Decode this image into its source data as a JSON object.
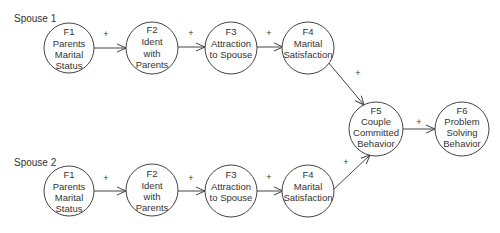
{
  "groups": [
    {
      "label": "Spouse 1"
    },
    {
      "label": "Spouse 2"
    }
  ],
  "nodes": [
    {
      "id": "s1f1",
      "lines": [
        "F1",
        "Parents",
        "Marital",
        "Status"
      ]
    },
    {
      "id": "s1f2",
      "lines": [
        "F2",
        "Ident",
        "with",
        "Parents"
      ]
    },
    {
      "id": "s1f3",
      "lines": [
        "F3",
        "Attraction",
        "to Spouse"
      ]
    },
    {
      "id": "s1f4",
      "lines": [
        "F4",
        "Marital",
        "Satisfaction"
      ]
    },
    {
      "id": "s2f1",
      "lines": [
        "F1",
        "Parents",
        "Marital",
        "Status"
      ]
    },
    {
      "id": "s2f2",
      "lines": [
        "F2",
        "Ident",
        "with",
        "Parents"
      ]
    },
    {
      "id": "s2f3",
      "lines": [
        "F3",
        "Attraction",
        "to Spouse"
      ]
    },
    {
      "id": "s2f4",
      "lines": [
        "F4",
        "Marital",
        "Satisfaction"
      ]
    },
    {
      "id": "f5",
      "lines": [
        "F5",
        "Couple",
        "Committed",
        "Behavior"
      ]
    },
    {
      "id": "f6",
      "lines": [
        "F6",
        "Problem",
        "Solving",
        "Behavior"
      ]
    }
  ],
  "edges": [
    {
      "from": "s1f1",
      "to": "s1f2",
      "sign": "+"
    },
    {
      "from": "s1f2",
      "to": "s1f3",
      "sign": "+"
    },
    {
      "from": "s1f3",
      "to": "s1f4",
      "sign": "+"
    },
    {
      "from": "s1f4",
      "to": "f5",
      "sign": "+"
    },
    {
      "from": "s2f1",
      "to": "s2f2",
      "sign": "+"
    },
    {
      "from": "s2f2",
      "to": "s2f3",
      "sign": "+"
    },
    {
      "from": "s2f3",
      "to": "s2f4",
      "sign": "+"
    },
    {
      "from": "s2f4",
      "to": "f5",
      "sign": "+"
    },
    {
      "from": "f5",
      "to": "f6",
      "sign": "+"
    }
  ]
}
